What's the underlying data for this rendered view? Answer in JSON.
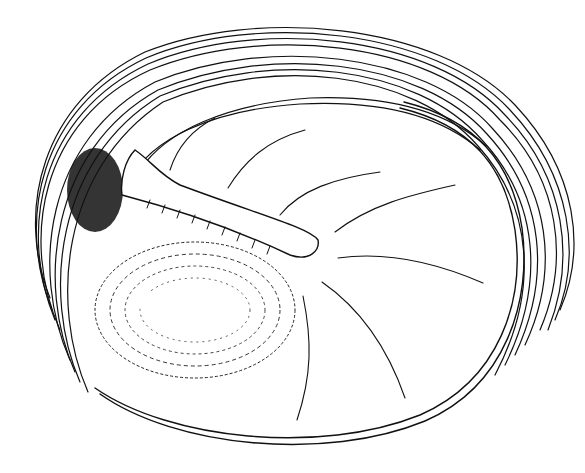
{
  "figure": {
    "kind": "anatomical line drawing",
    "background": "#ffffff",
    "ink": "#111111",
    "labels": []
  }
}
